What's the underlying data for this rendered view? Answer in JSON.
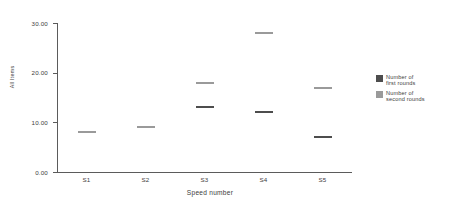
{
  "chart_data": {
    "type": "scatter",
    "title": "",
    "xlabel": "Speed number",
    "ylabel": "All Items",
    "categories": [
      "S1",
      "S2",
      "S3",
      "S4",
      "S5"
    ],
    "series": [
      {
        "name": "Number of first rounds",
        "color": "#4d4d4d",
        "values": [
          8,
          9,
          13,
          12,
          7
        ]
      },
      {
        "name": "Number of second rounds",
        "color": "#9a9a9a",
        "values": [
          8,
          9,
          18,
          28,
          17
        ]
      }
    ],
    "ylim": [
      0,
      30
    ],
    "yticks": [
      0,
      10,
      20,
      30
    ],
    "ytick_labels": [
      "0.00",
      "10.00",
      "20.00",
      "30.00"
    ],
    "grid": false,
    "legend_position": "right"
  },
  "legend": {
    "entries": [
      {
        "label": "Number of\nfirst rounds"
      },
      {
        "label": "Number of\nsecond rounds"
      }
    ]
  }
}
